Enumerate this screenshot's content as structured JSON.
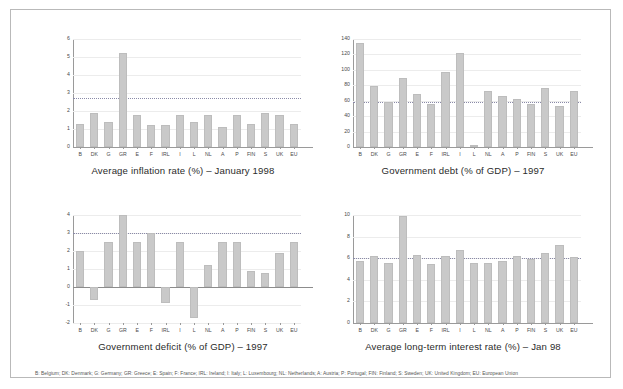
{
  "figure": {
    "background": "#ffffff",
    "border_color": "#b9b9b9",
    "bar_color": "#c9c9c9",
    "reference_line_color": "#8a8aa8",
    "footnote": "B: Belgium; DK: Denmark; G: Germany; GR: Greece; E: Spain; F: France; IRL: Ireland; I: Italy; L: Luxembourg; NL: Netherlands; A: Austria; P: Portugal; FIN: Finland; S: Sweden; UK: United Kingdom; EU: European Union"
  },
  "chart_data": [
    {
      "type": "bar",
      "title": "Average inflation rate (%) – January 1998",
      "xlabel": "",
      "ylabel": "",
      "ylim": [
        0,
        6
      ],
      "yticks": [
        0,
        1,
        2,
        3,
        4,
        5,
        6
      ],
      "ytick_labels": [
        "0",
        "1",
        "2",
        "3",
        "4",
        "5",
        "6"
      ],
      "grid": true,
      "legend": "none",
      "reference_line": 2.7,
      "categories": [
        "B",
        "DK",
        "G",
        "GR",
        "E",
        "F",
        "IRL",
        "I",
        "L",
        "NL",
        "A",
        "P",
        "FIN",
        "S",
        "UK",
        "EU"
      ],
      "values": [
        1.3,
        1.9,
        1.4,
        5.2,
        1.8,
        1.2,
        1.2,
        1.8,
        1.4,
        1.8,
        1.1,
        1.8,
        1.3,
        1.9,
        1.8,
        1.3
      ]
    },
    {
      "type": "bar",
      "title": "Government debt (% of GDP) – 1997",
      "xlabel": "",
      "ylabel": "",
      "ylim": [
        0,
        140
      ],
      "yticks": [
        0,
        20,
        40,
        60,
        80,
        100,
        120,
        140
      ],
      "ytick_labels": [
        "0",
        "20",
        "40",
        "60",
        "80",
        "100",
        "120",
        "140"
      ],
      "grid": true,
      "legend": "none",
      "reference_line": 58,
      "categories": [
        "B",
        "DK",
        "G",
        "GR",
        "E",
        "F",
        "IRL",
        "I",
        "L",
        "NL",
        "A",
        "P",
        "FIN",
        "S",
        "UK",
        "EU"
      ],
      "values": [
        135,
        79,
        58,
        89,
        69,
        56,
        97,
        122,
        2,
        72,
        66,
        62,
        56,
        77,
        53,
        72
      ]
    },
    {
      "type": "bar",
      "title": "Government deficit (% of GDP) – 1997",
      "xlabel": "",
      "ylabel": "",
      "ylim": [
        -2,
        4
      ],
      "yticks": [
        -2,
        -1,
        0,
        1,
        2,
        3,
        4
      ],
      "ytick_labels": [
        "-2",
        "-1",
        "0",
        "1",
        "2",
        "3",
        "4"
      ],
      "grid": true,
      "legend": "none",
      "reference_line": 3.0,
      "categories": [
        "B",
        "DK",
        "G",
        "GR",
        "E",
        "F",
        "IRL",
        "I",
        "L",
        "NL",
        "A",
        "P",
        "FIN",
        "S",
        "UK",
        "EU"
      ],
      "values": [
        2.0,
        -0.7,
        2.5,
        4.0,
        2.5,
        3.0,
        -0.9,
        2.5,
        -1.7,
        1.2,
        2.5,
        2.5,
        0.9,
        0.8,
        1.9,
        2.5
      ]
    },
    {
      "type": "bar",
      "title": "Average long-term interest rate (%) – Jan 98",
      "xlabel": "",
      "ylabel": "",
      "ylim": [
        0,
        10
      ],
      "yticks": [
        0,
        2,
        4,
        6,
        8,
        10
      ],
      "ytick_labels": [
        "0",
        "2",
        "4",
        "6",
        "8",
        "10"
      ],
      "grid": true,
      "legend": "none",
      "reference_line": 6.0,
      "categories": [
        "B",
        "DK",
        "G",
        "GR",
        "E",
        "F",
        "IRL",
        "I",
        "L",
        "NL",
        "A",
        "P",
        "FIN",
        "S",
        "UK",
        "EU"
      ],
      "values": [
        5.7,
        6.2,
        5.6,
        9.9,
        6.3,
        5.5,
        6.2,
        6.8,
        5.6,
        5.6,
        5.7,
        6.2,
        5.9,
        6.5,
        7.2,
        6.1
      ]
    }
  ]
}
